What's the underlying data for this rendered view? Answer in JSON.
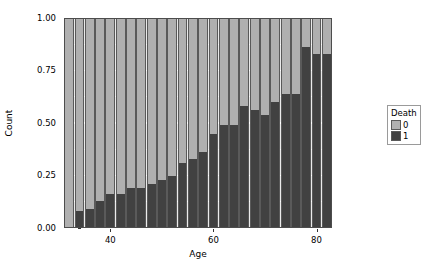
{
  "chart_data": {
    "type": "bar",
    "title": "",
    "subtitle": "",
    "xlabel": "Age",
    "ylabel": "Count",
    "stacked": true,
    "position": "fill",
    "xlim": [
      31,
      83
    ],
    "ylim": [
      0,
      1
    ],
    "grid": true,
    "x_ticks": [
      40,
      60,
      80
    ],
    "x_tick_labels": [
      "40",
      "60",
      "80"
    ],
    "x_minor_ticks": [
      30,
      50,
      70
    ],
    "y_ticks": [
      0.0,
      0.25,
      0.5,
      0.75,
      1.0
    ],
    "y_tick_labels": [
      "0.00",
      "0.25",
      "0.50",
      "0.75",
      "1.00"
    ],
    "y_minor_ticks": [
      0.125,
      0.375,
      0.625,
      0.875
    ],
    "legend": {
      "title": "Death",
      "position": "right",
      "entries": [
        {
          "label": "0",
          "color": "#b0b0b0"
        },
        {
          "label": "1",
          "color": "#414141"
        }
      ]
    },
    "bar_width": 0.95,
    "x": [
      32,
      34,
      36,
      38,
      40,
      42,
      44,
      46,
      48,
      50,
      52,
      54,
      56,
      58,
      60,
      62,
      64,
      66,
      68,
      70,
      72,
      74,
      76,
      78,
      80,
      82
    ],
    "series": [
      {
        "name": "1",
        "color": "#414141",
        "values": [
          0.0,
          0.08,
          0.09,
          0.13,
          0.16,
          0.16,
          0.19,
          0.19,
          0.21,
          0.23,
          0.25,
          0.31,
          0.33,
          0.36,
          0.45,
          0.49,
          0.49,
          0.58,
          0.56,
          0.54,
          0.6,
          0.64,
          0.64,
          0.86,
          0.83,
          0.83
        ]
      },
      {
        "name": "0",
        "color": "#b0b0b0",
        "values": [
          1.0,
          0.92,
          0.91,
          0.87,
          0.84,
          0.84,
          0.81,
          0.81,
          0.79,
          0.77,
          0.75,
          0.69,
          0.67,
          0.64,
          0.55,
          0.51,
          0.51,
          0.42,
          0.44,
          0.46,
          0.4,
          0.36,
          0.36,
          0.14,
          0.17,
          0.17
        ]
      }
    ]
  },
  "style": {
    "panel_background": "#ebebeb",
    "grid_color": "#ffffff",
    "bar_outline": "#5a5a5a",
    "panel_border": "#4d4d4d",
    "text_color": "#000000",
    "figure_background": "#ffffff"
  }
}
